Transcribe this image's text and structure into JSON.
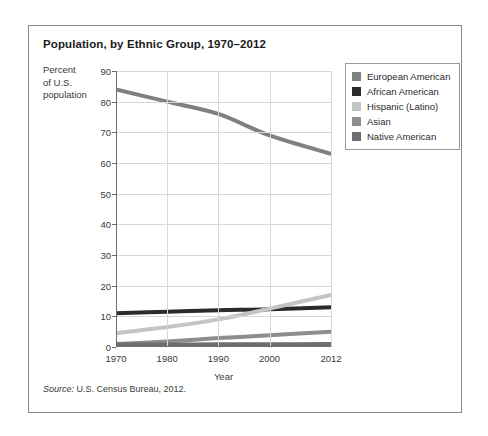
{
  "card": {
    "title": "Population, by Ethnic Group, 1970–2012",
    "source_word": "Source:",
    "source_text": " U.S. Census Bureau, 2012."
  },
  "chart_data": {
    "type": "line",
    "title": "Population, by Ethnic Group, 1970–2012",
    "xlabel": "Year",
    "ylabel": "Percent of U.S. population",
    "ylabel_lines": [
      "Percent",
      "of U.S.",
      "population"
    ],
    "x": [
      1970,
      1980,
      1990,
      2000,
      2012
    ],
    "xticklabels": [
      "1970",
      "1980",
      "1990",
      "2000",
      "2012"
    ],
    "xlim": [
      1970,
      2012
    ],
    "ylim": [
      0,
      90
    ],
    "yticks": [
      0,
      10,
      20,
      30,
      40,
      50,
      60,
      70,
      80,
      90
    ],
    "yticklabels": [
      "0",
      "10",
      "20",
      "30",
      "40",
      "50",
      "60",
      "70",
      "80",
      "90"
    ],
    "grid": true,
    "legend_position": "top-right",
    "series": [
      {
        "name": "European American",
        "color": "#808080",
        "values": [
          84,
          80,
          76,
          69,
          63
        ]
      },
      {
        "name": "African American",
        "color": "#2b2b2b",
        "values": [
          11,
          11.5,
          12,
          12.3,
          13
        ]
      },
      {
        "name": "Hispanic (Latino)",
        "color": "#c4c4c4",
        "values": [
          4.5,
          6.5,
          9,
          12.5,
          17
        ]
      },
      {
        "name": "Asian",
        "color": "#8d8d8d",
        "values": [
          1,
          1.8,
          2.9,
          3.8,
          5
        ]
      },
      {
        "name": "Native American",
        "color": "#6e6e6e",
        "values": [
          0.8,
          0.8,
          0.9,
          0.9,
          1
        ]
      }
    ]
  }
}
